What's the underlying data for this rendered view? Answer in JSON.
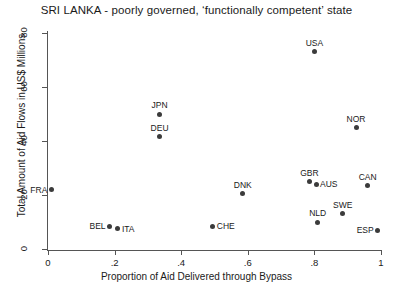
{
  "chart_data": {
    "type": "scatter",
    "title": "SRI LANKA - poorly governed, ‘functionally competent’ state",
    "xlabel": "Proportion of Aid Delivered through Bypass",
    "ylabel": "Total Amount of Aid Flows in US$ Millions",
    "xlim": [
      0,
      1
    ],
    "ylim": [
      0,
      80
    ],
    "grid": false,
    "legend": "none",
    "xticks": [
      {
        "value": 0,
        "label": "0"
      },
      {
        "value": 0.2,
        "label": ".2"
      },
      {
        "value": 0.4,
        "label": ".4"
      },
      {
        "value": 0.6,
        "label": ".6"
      },
      {
        "value": 0.8,
        "label": ".8"
      },
      {
        "value": 1,
        "label": "1"
      }
    ],
    "yticks": [
      {
        "value": 0,
        "label": "0"
      },
      {
        "value": 20,
        "label": "20"
      },
      {
        "value": 40,
        "label": "40"
      },
      {
        "value": 60,
        "label": "60"
      },
      {
        "value": 80,
        "label": "80"
      }
    ],
    "points": [
      {
        "label": "FRA",
        "x": 0.01,
        "y": 22.0,
        "label_pos": "left"
      },
      {
        "label": "BEL",
        "x": 0.185,
        "y": 8.5,
        "label_pos": "left"
      },
      {
        "label": "ITA",
        "x": 0.21,
        "y": 7.5,
        "label_pos": "right"
      },
      {
        "label": "JPN",
        "x": 0.335,
        "y": 50.0,
        "label_pos": "above"
      },
      {
        "label": "DEU",
        "x": 0.335,
        "y": 41.5,
        "label_pos": "above"
      },
      {
        "label": "CHE",
        "x": 0.495,
        "y": 8.5,
        "label_pos": "right"
      },
      {
        "label": "DNK",
        "x": 0.585,
        "y": 20.5,
        "label_pos": "above"
      },
      {
        "label": "GBR",
        "x": 0.785,
        "y": 25.0,
        "label_pos": "above"
      },
      {
        "label": "AUS",
        "x": 0.805,
        "y": 24.0,
        "label_pos": "right"
      },
      {
        "label": "USA",
        "x": 0.8,
        "y": 73.0,
        "label_pos": "above"
      },
      {
        "label": "NLD",
        "x": 0.81,
        "y": 10.0,
        "label_pos": "above"
      },
      {
        "label": "SWE",
        "x": 0.885,
        "y": 13.0,
        "label_pos": "above"
      },
      {
        "label": "NOR",
        "x": 0.925,
        "y": 45.0,
        "label_pos": "above"
      },
      {
        "label": "CAN",
        "x": 0.96,
        "y": 23.5,
        "label_pos": "above"
      },
      {
        "label": "ESP",
        "x": 0.99,
        "y": 7.0,
        "label_pos": "left"
      }
    ]
  }
}
